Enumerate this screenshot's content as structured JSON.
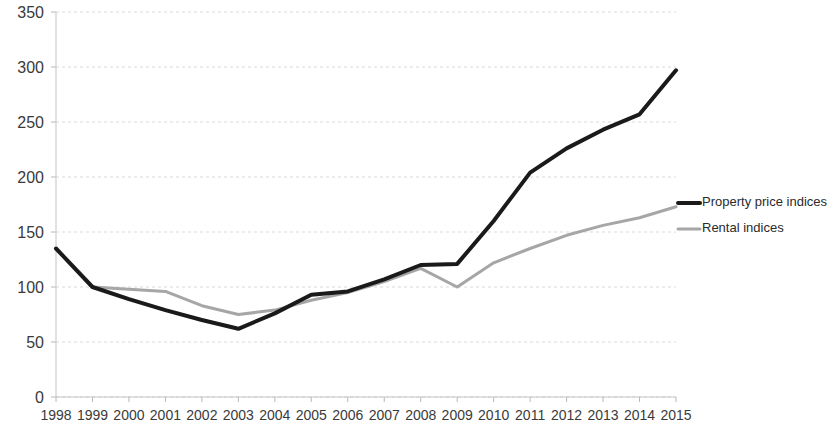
{
  "chart_data": {
    "type": "line",
    "title": "",
    "subtitle": "",
    "xlabel": "",
    "ylabel": "",
    "grid": true,
    "legend_position": "right",
    "ylim": [
      0,
      350
    ],
    "y_ticks": [
      0,
      50,
      100,
      150,
      200,
      250,
      300,
      350
    ],
    "categories": [
      "1998",
      "1999",
      "2000",
      "2001",
      "2002",
      "2003",
      "2004",
      "2005",
      "2006",
      "2007",
      "2008",
      "2009",
      "2010",
      "2011",
      "2012",
      "2013",
      "2014",
      "2015"
    ],
    "series": [
      {
        "name": "Property price indices",
        "color": "#1a1a1a",
        "width": 4,
        "values": [
          135,
          100,
          89,
          79,
          70,
          62,
          76,
          93,
          96,
          107,
          120,
          121,
          160,
          204,
          226,
          243,
          257,
          297
        ]
      },
      {
        "name": "Rental indices",
        "color": "#a6a6a6",
        "width": 3,
        "values": [
          135,
          100,
          98,
          96,
          83,
          75,
          79,
          88,
          95,
          105,
          117,
          100,
          122,
          135,
          147,
          156,
          163,
          173
        ]
      }
    ]
  },
  "legend": {
    "items": [
      {
        "label": "Property price indices",
        "color": "#1a1a1a"
      },
      {
        "label": "Rental indices",
        "color": "#a6a6a6"
      }
    ]
  }
}
